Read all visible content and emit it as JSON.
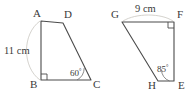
{
  "figure": {
    "background_color": "#ffffff",
    "line_color": "#4b4b4b",
    "guide_color": "#c9c6c0",
    "text_color": "#3a3a3a"
  },
  "shapes": [
    {
      "id": "quadrilateral-abcd",
      "name": "ABCD",
      "vertices": [
        {
          "label": "A",
          "x": 41,
          "y": 21
        },
        {
          "label": "D",
          "x": 63,
          "y": 23
        },
        {
          "label": "C",
          "x": 91,
          "y": 80
        },
        {
          "label": "B",
          "x": 41,
          "y": 80
        }
      ],
      "vertex_labels": [
        {
          "label": "A",
          "x": 33,
          "y": 17
        },
        {
          "label": "D",
          "x": 64,
          "y": 18
        },
        {
          "label": "C",
          "x": 93,
          "y": 88
        },
        {
          "label": "B",
          "x": 30,
          "y": 88
        }
      ],
      "measures": [
        {
          "label": "11 cm",
          "x": 4,
          "y": 54,
          "side": "AB"
        }
      ],
      "angles": [
        {
          "label": "60",
          "unit": "°",
          "x": 70,
          "y": 76,
          "at": "C"
        },
        {
          "label": "right angle",
          "at": "B"
        }
      ]
    },
    {
      "id": "quadrilateral-gfeh",
      "name": "GFEH",
      "vertices": [
        {
          "label": "G",
          "x": 122,
          "y": 22
        },
        {
          "label": "F",
          "x": 174,
          "y": 22
        },
        {
          "label": "E",
          "x": 174,
          "y": 81
        },
        {
          "label": "H",
          "x": 158,
          "y": 81
        }
      ],
      "vertex_labels": [
        {
          "label": "G",
          "x": 111,
          "y": 18
        },
        {
          "label": "F",
          "x": 177,
          "y": 18
        },
        {
          "label": "E",
          "x": 178,
          "y": 89
        },
        {
          "label": "H",
          "x": 148,
          "y": 89
        }
      ],
      "measures": [
        {
          "label": "9 cm",
          "x": 135,
          "y": 12,
          "side": "GF"
        }
      ],
      "angles": [
        {
          "label": "85",
          "unit": "°",
          "x": 157,
          "y": 72,
          "at": "H"
        },
        {
          "label": "right angle",
          "at": "F"
        }
      ]
    }
  ]
}
